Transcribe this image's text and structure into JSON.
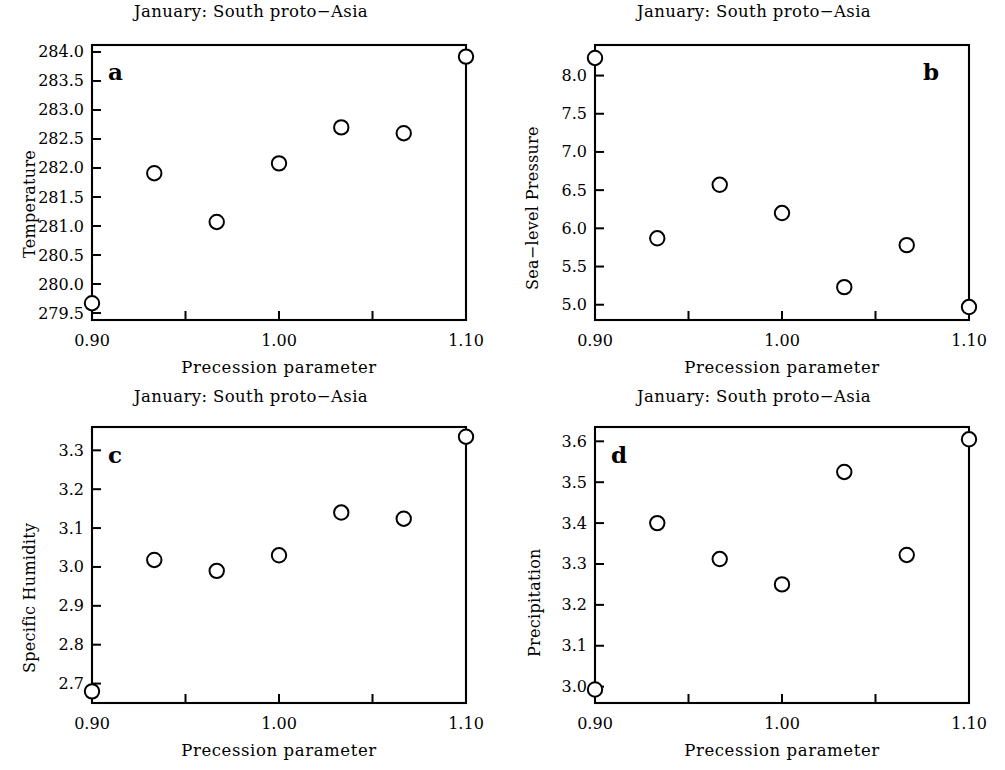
{
  "figure": {
    "background": "#ffffff",
    "ink": "#000000",
    "panel_count": 4
  },
  "chart_data": [
    {
      "type": "scatter",
      "panel_letter": "a",
      "title": "January: South proto−Asia",
      "xlabel": "Precession parameter",
      "ylabel": "Temperature",
      "x": [
        0.9,
        0.9333,
        0.9667,
        1.0,
        1.0333,
        1.0667,
        1.1
      ],
      "values": [
        279.67,
        281.91,
        281.07,
        282.08,
        282.7,
        282.6,
        283.92
      ],
      "xlim": [
        0.9,
        1.1
      ],
      "ylim": [
        279.38,
        284.12
      ],
      "xticks": [
        0.9,
        0.95,
        1.0,
        1.05,
        1.1
      ],
      "xticklabels": [
        "0.90",
        "",
        "1.00",
        "",
        "1.10"
      ],
      "yticks": [
        279.5,
        280.0,
        280.5,
        281.0,
        281.5,
        282.0,
        282.5,
        283.0,
        283.5,
        284.0
      ],
      "yticklabels": [
        "279.5",
        "280.0",
        "280.5",
        "281.0",
        "281.5",
        "282.0",
        "282.5",
        "283.0",
        "283.5",
        "284.0"
      ],
      "grid": false,
      "legend": "none",
      "marker": "open-circle"
    },
    {
      "type": "scatter",
      "panel_letter": "b",
      "title": "January: South proto−Asia",
      "xlabel": "Precession parameter",
      "ylabel": "Sea−level Pressure",
      "x": [
        0.9,
        0.9333,
        0.9667,
        1.0,
        1.0333,
        1.0667,
        1.1
      ],
      "values": [
        8.23,
        5.87,
        6.57,
        6.2,
        5.23,
        5.78,
        4.97
      ],
      "xlim": [
        0.9,
        1.1
      ],
      "ylim": [
        4.8,
        8.4
      ],
      "xticks": [
        0.9,
        0.95,
        1.0,
        1.05,
        1.1
      ],
      "xticklabels": [
        "0.90",
        "",
        "1.00",
        "",
        "1.10"
      ],
      "yticks": [
        5.0,
        5.5,
        6.0,
        6.5,
        7.0,
        7.5,
        8.0
      ],
      "yticklabels": [
        "5.0",
        "5.5",
        "6.0",
        "6.5",
        "7.0",
        "7.5",
        "8.0"
      ],
      "grid": false,
      "legend": "none",
      "marker": "open-circle"
    },
    {
      "type": "scatter",
      "panel_letter": "c",
      "title": "January: South proto−Asia",
      "xlabel": "Precession parameter",
      "ylabel": "Specific Humidity",
      "x": [
        0.9,
        0.9333,
        0.9667,
        1.0,
        1.0333,
        1.0667,
        1.1
      ],
      "values": [
        2.68,
        3.018,
        2.99,
        3.03,
        3.14,
        3.124,
        3.335
      ],
      "xlim": [
        0.9,
        1.1
      ],
      "ylim": [
        2.65,
        3.36
      ],
      "xticks": [
        0.9,
        0.95,
        1.0,
        1.05,
        1.1
      ],
      "xticklabels": [
        "0.90",
        "",
        "1.00",
        "",
        "1.10"
      ],
      "yticks": [
        2.7,
        2.8,
        2.9,
        3.0,
        3.1,
        3.2,
        3.3
      ],
      "yticklabels": [
        "2.7",
        "2.8",
        "2.9",
        "3.0",
        "3.1",
        "3.2",
        "3.3"
      ],
      "grid": false,
      "legend": "none",
      "marker": "open-circle"
    },
    {
      "type": "scatter",
      "panel_letter": "d",
      "title": "January: South proto−Asia",
      "xlabel": "Precession parameter",
      "ylabel": "Precipitation",
      "x": [
        0.9,
        0.9333,
        0.9667,
        1.0,
        1.0333,
        1.0667,
        1.1
      ],
      "values": [
        2.993,
        3.4,
        3.312,
        3.25,
        3.525,
        3.322,
        3.605
      ],
      "xlim": [
        0.9,
        1.1
      ],
      "ylim": [
        2.96,
        3.635
      ],
      "xticks": [
        0.9,
        0.95,
        1.0,
        1.05,
        1.1
      ],
      "xticklabels": [
        "0.90",
        "",
        "1.00",
        "",
        "1.10"
      ],
      "yticks": [
        3.0,
        3.1,
        3.2,
        3.3,
        3.4,
        3.5,
        3.6
      ],
      "yticklabels": [
        "3.0",
        "3.1",
        "3.2",
        "3.3",
        "3.4",
        "3.5",
        "3.6"
      ],
      "grid": false,
      "legend": "none",
      "marker": "open-circle"
    }
  ]
}
